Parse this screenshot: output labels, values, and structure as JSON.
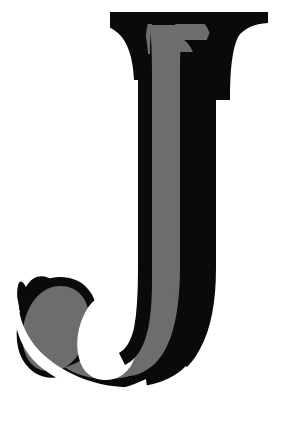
{
  "document": {
    "kind": "letterform-specimen",
    "title": "Letter J",
    "character": "J",
    "script": "Latin",
    "case": "uppercase",
    "style": "serif-display",
    "background_color": "#ffffff"
  },
  "canvas": {
    "width": 303,
    "height": 423
  },
  "glyph": {
    "name": "capital-j",
    "character": "J",
    "outline_color": "#0a0a0a",
    "inner_shade_color": "#6d6d6d",
    "counter_color": "#ffffff",
    "description": "Serif capital J with bracketed top serif, tapered vertical stem, and a descending hook terminating in a closed ball-like bowl to the left.",
    "parts": [
      {
        "name": "top-serif",
        "label": "Top serif bar",
        "color": "#0a0a0a",
        "extent_x": [
          95,
          268
        ],
        "extent_y": [
          12,
          23
        ]
      },
      {
        "name": "stem",
        "label": "Vertical stem",
        "color": "#0a0a0a",
        "extent_x": [
          138,
          212
        ],
        "extent_y": [
          23,
          330
        ]
      },
      {
        "name": "stem-highlight",
        "label": "Stem inner shade",
        "color": "#6d6d6d",
        "extent_x": [
          147,
          184
        ],
        "extent_y": [
          28,
          360
        ]
      },
      {
        "name": "hook",
        "label": "Descending hook",
        "color": "#0a0a0a",
        "extent_x": [
          18,
          212
        ],
        "extent_y": [
          278,
          388
        ]
      },
      {
        "name": "hook-highlight",
        "label": "Hook inner shade",
        "color": "#6d6d6d",
        "extent_x": [
          30,
          190
        ],
        "extent_y": [
          288,
          372
        ]
      },
      {
        "name": "counter",
        "label": "Inner white counter",
        "color": "#ffffff",
        "extent_x": [
          82,
          140
        ],
        "extent_y": [
          300,
          382
        ]
      }
    ]
  }
}
